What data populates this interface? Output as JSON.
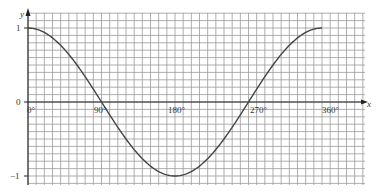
{
  "chart_data": {
    "type": "line",
    "title": "",
    "xlabel": "x",
    "ylabel": "y",
    "x_tick_labels": [
      "0°",
      "90°",
      "180°",
      "270°",
      "360°"
    ],
    "y_tick_labels": [
      "1",
      "0",
      "−1"
    ],
    "xlim": [
      0,
      410
    ],
    "ylim": [
      -1.1,
      1.2
    ],
    "grid": true,
    "legend": null,
    "series": [
      {
        "name": "y = cos x",
        "x": [
          0,
          30,
          60,
          90,
          120,
          150,
          180,
          210,
          240,
          270,
          300,
          330,
          360
        ],
        "y": [
          1,
          0.87,
          0.5,
          0,
          -0.5,
          -0.87,
          -1,
          -0.87,
          -0.5,
          0,
          0.5,
          0.87,
          1
        ]
      }
    ],
    "colors": {
      "curve": "#444444",
      "grid": "#9a9a9a",
      "axis": "#222222"
    }
  },
  "labels": {
    "y_axis": "y",
    "x_axis": "x",
    "y_one": "1",
    "y_zero": "0",
    "y_minus_one": "−1",
    "x0": "0°",
    "x90": "90°",
    "x180": "180°",
    "x270": "270°",
    "x360": "360°"
  }
}
